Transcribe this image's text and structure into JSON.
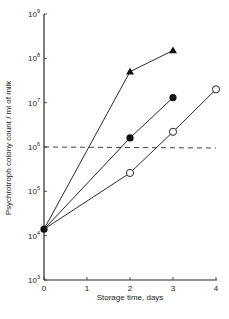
{
  "chart_data": {
    "type": "line",
    "title": "",
    "xlabel": "Storage time, days",
    "ylabel": "Psychrotroph colony count / ml of milk",
    "yscale": "log",
    "xlim": [
      0,
      4
    ],
    "ylim": [
      1000,
      1000000000
    ],
    "x_ticks": [
      0,
      1,
      2,
      3,
      4
    ],
    "x_tick_labels": [
      "0",
      "1",
      "2",
      "3",
      "4"
    ],
    "y_ticks": [
      1000,
      10000,
      100000,
      1000000,
      10000000,
      100000000,
      1000000000
    ],
    "y_tick_labels": [
      {
        "base": "10",
        "exp": "3"
      },
      {
        "base": "10",
        "exp": "4"
      },
      {
        "base": "10",
        "exp": "5"
      },
      {
        "base": "10",
        "exp": "6"
      },
      {
        "base": "10",
        "exp": "7"
      },
      {
        "base": "10",
        "exp": "8"
      },
      {
        "base": "10",
        "exp": "9"
      }
    ],
    "grid": false,
    "legend": null,
    "series": [
      {
        "name": "filled-triangle",
        "marker": "triangle-filled",
        "x": [
          0,
          2,
          3
        ],
        "y": [
          14000,
          50000000,
          150000000
        ]
      },
      {
        "name": "filled-circle",
        "marker": "circle-filled",
        "x": [
          0,
          2,
          3
        ],
        "y": [
          14000,
          1600000,
          13000000
        ]
      },
      {
        "name": "open-circle",
        "marker": "circle-open",
        "x": [
          0,
          2,
          3,
          4
        ],
        "y": [
          14000,
          260000,
          2200000,
          20000000
        ]
      }
    ],
    "reference_lines": [
      {
        "type": "horizontal",
        "style": "dashed",
        "y": 1000000,
        "x_range": [
          0,
          4
        ]
      }
    ]
  }
}
